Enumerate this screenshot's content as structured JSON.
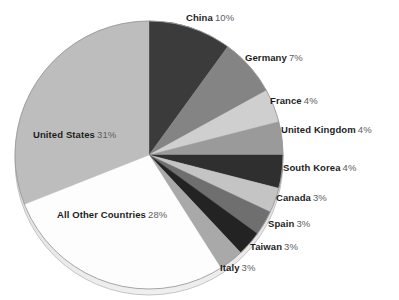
{
  "chart_data": {
    "type": "pie",
    "title": "",
    "subtitle": "",
    "xlabel": "",
    "ylabel": "",
    "legend_position": "none",
    "grid": false,
    "units": "percent",
    "total": 100,
    "start_angle_deg": 0,
    "direction": "clockwise",
    "categories": [
      "China",
      "Germany",
      "France",
      "United Kingdom",
      "South Korea",
      "Canada",
      "Spain",
      "Taiwan",
      "Italy",
      "All Other Countries",
      "United States"
    ],
    "values": [
      10,
      7,
      4,
      4,
      4,
      3,
      3,
      3,
      3,
      28,
      31
    ],
    "slices": [
      {
        "label": "China",
        "value": 10,
        "pct_text": "10%",
        "color": "#3b3b3b",
        "label_side": "right",
        "label_x": 186,
        "label_y": 12,
        "leader": false
      },
      {
        "label": "Germany",
        "value": 7,
        "pct_text": "7%",
        "color": "#848484",
        "label_side": "right",
        "label_x": 245,
        "label_y": 52,
        "leader": false
      },
      {
        "label": "France",
        "value": 4,
        "pct_text": "4%",
        "color": "#cfcfcf",
        "label_side": "right",
        "label_x": 270,
        "label_y": 95,
        "leader": false
      },
      {
        "label": "United Kingdom",
        "value": 4,
        "pct_text": "4%",
        "color": "#9a9a9a",
        "label_side": "right",
        "label_x": 281,
        "label_y": 124,
        "leader": false
      },
      {
        "label": "South Korea",
        "value": 4,
        "pct_text": "4%",
        "color": "#2f2f2f",
        "label_side": "right",
        "label_x": 283,
        "label_y": 162,
        "leader": false
      },
      {
        "label": "Canada",
        "value": 3,
        "pct_text": "3%",
        "color": "#c4c4c4",
        "label_side": "right",
        "label_x": 276,
        "label_y": 192,
        "leader": false
      },
      {
        "label": "Spain",
        "value": 3,
        "pct_text": "3%",
        "color": "#6f6f6f",
        "label_side": "right",
        "label_x": 268,
        "label_y": 218,
        "leader": false
      },
      {
        "label": "Taiwan",
        "value": 3,
        "pct_text": "3%",
        "color": "#232323",
        "label_side": "right",
        "label_x": 250,
        "label_y": 241,
        "leader": false
      },
      {
        "label": "Italy",
        "value": 3,
        "pct_text": "3%",
        "color": "#a9a9a9",
        "label_side": "right",
        "label_x": 220,
        "label_y": 262,
        "leader": false
      },
      {
        "label": "All Other Countries",
        "value": 28,
        "pct_text": "28%",
        "color": "#fdfdfd",
        "label_side": "left",
        "label_x": 57,
        "label_y": 209,
        "leader": false
      },
      {
        "label": "United States",
        "value": 31,
        "pct_text": "31%",
        "color": "#bdbdbd",
        "label_side": "left",
        "label_x": 33,
        "label_y": 129,
        "leader": false
      }
    ],
    "geometry": {
      "center_x": 149,
      "center_y": 155,
      "radius": 134,
      "depth": 6,
      "outline_color": "#9b9b9b"
    }
  }
}
